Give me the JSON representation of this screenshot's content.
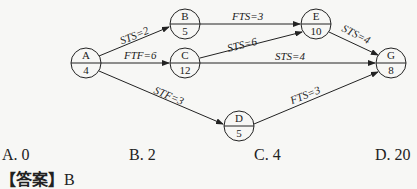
{
  "diagram": {
    "nodes": [
      {
        "id": "A",
        "duration": "4",
        "cx": 86,
        "cy": 63
      },
      {
        "id": "B",
        "duration": "5",
        "cx": 185,
        "cy": 24
      },
      {
        "id": "C",
        "duration": "12",
        "cx": 185,
        "cy": 63
      },
      {
        "id": "E",
        "duration": "10",
        "cx": 316,
        "cy": 24
      },
      {
        "id": "G",
        "duration": "8",
        "cx": 391,
        "cy": 63
      },
      {
        "id": "D",
        "duration": "5",
        "cx": 239,
        "cy": 126
      }
    ],
    "edges": [
      {
        "from": "A",
        "to": "B",
        "label": "STS=2"
      },
      {
        "from": "A",
        "to": "C",
        "label": "FTF=6"
      },
      {
        "from": "A",
        "to": "D",
        "label": "STF=3"
      },
      {
        "from": "B",
        "to": "E",
        "label": "FTS=3"
      },
      {
        "from": "C",
        "to": "E",
        "label": "STS=6"
      },
      {
        "from": "C",
        "to": "G",
        "label": "STS=4"
      },
      {
        "from": "E",
        "to": "G",
        "label": "STS=4"
      },
      {
        "from": "D",
        "to": "G",
        "label": "FTS=3"
      }
    ]
  },
  "options": [
    {
      "label": "A. 0"
    },
    {
      "label": "B. 2"
    },
    {
      "label": "C. 4"
    },
    {
      "label": "D. 20"
    }
  ],
  "answer": {
    "bracket": "【答案】",
    "value": "B"
  }
}
